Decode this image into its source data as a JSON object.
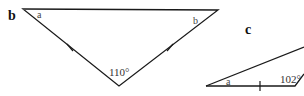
{
  "figures": [
    {
      "id": "b",
      "label": "b",
      "shape": "isosceles-triangle",
      "angle_labels": {
        "left": "a",
        "right": "b",
        "bottom": "110°"
      },
      "equal_side_ticks": 2
    },
    {
      "id": "c",
      "label": "c",
      "shape": "triangle",
      "angle_labels": {
        "left": "a",
        "bottom_right": "102°"
      },
      "equal_side_ticks": 1
    }
  ],
  "colors": {
    "stroke": "#1a1a1a",
    "background": "#ffffff"
  }
}
